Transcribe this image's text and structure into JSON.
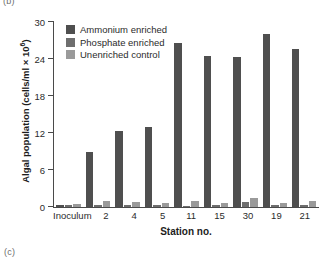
{
  "panel_letter_top": "(b)",
  "panel_letter_bottom": "(c)",
  "chart_data": {
    "type": "bar",
    "title": "",
    "xlabel": "Station no.",
    "ylabel": "Algal population (cells/ml × 10⁶)",
    "ylabel_base": "Algal population (cells/ml × 10",
    "ylabel_exp": "6",
    "ylabel_tail": ")",
    "categories": [
      "Inoculum",
      "2",
      "4",
      "5",
      "11",
      "15",
      "30",
      "19",
      "21"
    ],
    "ylim": [
      0,
      30
    ],
    "yticks": [
      0,
      6,
      12,
      18,
      24,
      30
    ],
    "ytick_labels": [
      "0",
      "6",
      "12",
      "18",
      "24",
      "30"
    ],
    "grid": false,
    "legend_position": "top-left",
    "series": [
      {
        "name": "Ammonium enriched",
        "color": "#4f4f4f",
        "values": [
          0.4,
          9.0,
          12.3,
          13.0,
          26.6,
          24.5,
          24.4,
          28.0,
          25.6
        ]
      },
      {
        "name": "Phosphate enriched",
        "color": "#6e6e6e",
        "values": [
          0.3,
          0.4,
          0.4,
          0.4,
          0.2,
          0.3,
          0.8,
          0.3,
          0.3
        ]
      },
      {
        "name": "Unenriched control",
        "color": "#9a9a9a",
        "values": [
          0.5,
          0.9,
          0.8,
          0.7,
          1.0,
          0.7,
          1.5,
          0.7,
          0.9
        ]
      }
    ]
  }
}
